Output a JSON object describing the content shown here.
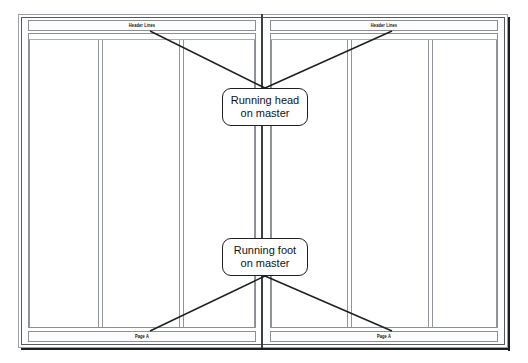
{
  "diagram": {
    "colors": {
      "frame_outer": "#9aa0a6",
      "frame_inner": "#55595d",
      "shadow": "#1d1f21",
      "guide_line": "#90969c",
      "band_border": "#8b9096",
      "spine": "#3c4043",
      "callout_border": "#1d1f21",
      "text": "#111315",
      "page_background": "#ffffff"
    }
  },
  "spread": {
    "pages": [
      {
        "name": "left-page",
        "header": {
          "text": "Header Lines"
        },
        "footer": {
          "text": "Page A"
        },
        "columns": 3
      },
      {
        "name": "right-page",
        "header": {
          "text": "Header Lines"
        },
        "footer": {
          "text": "Page A"
        },
        "columns": 3
      }
    ]
  },
  "callouts": [
    {
      "name": "running-head-callout",
      "line1": "Running head",
      "line2": "on master"
    },
    {
      "name": "running-foot-callout",
      "line1": "Running foot",
      "line2": "on master"
    }
  ]
}
